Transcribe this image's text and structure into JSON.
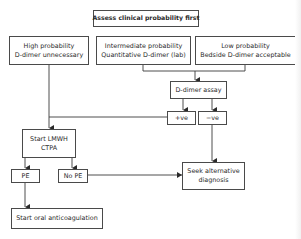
{
  "flowchart": {
    "title": "Assess clinical probability first",
    "probability_boxes": {
      "high": {
        "line1": "High probability",
        "line2": "D-dimer unnecessary"
      },
      "intermediate": {
        "line1": "Intermediate probability",
        "line2": "Quantitative D-dimer (lab)"
      },
      "low": {
        "line1": "Low probability",
        "line2": "Bedside D-dimer acceptable"
      }
    },
    "d_dimer_assay": "D-dimer assay",
    "positive": "+ve",
    "negative": "−ve",
    "start_lmwh": {
      "line1": "Start LMWH",
      "line2": "CTPA"
    },
    "pe": "PE",
    "no_pe": "No PE",
    "seek_alternative": {
      "line1": "Seek alternative",
      "line2": "diagnosis"
    },
    "start_oral": "Start oral anticoagulation"
  },
  "colors": {
    "line": "#3a3a3a",
    "border": "#4a4a4a",
    "background": "#ffffff"
  }
}
